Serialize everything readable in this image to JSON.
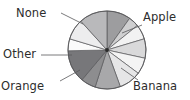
{
  "chart_data": {
    "type": "pie",
    "title": "",
    "xlabel": "",
    "ylabel": "",
    "legend_position": "none",
    "grid": false,
    "labeled_categories": [
      "Apple",
      "Banana",
      "Orange",
      "Other",
      "None"
    ],
    "categories": [
      "Apple",
      "slice-2",
      "slice-3",
      "Banana",
      "slice-5",
      "slice-6",
      "Orange",
      "slice-8",
      "Other",
      "slice-10",
      "None",
      "slice-12"
    ],
    "values": [
      32,
      14,
      20,
      26,
      22,
      30,
      34,
      20,
      44,
      16,
      28,
      38
    ],
    "start_angle_deg": -90,
    "direction": "clockwise",
    "colors": [
      "#9d9d9f",
      "#cfcfd0",
      "#f2f2f2",
      "#d9d9da",
      "#f4f4f4",
      "#e6e6e7",
      "#a8a8aa",
      "#8d8d8f",
      "#77777a",
      "#fbfbfb",
      "#ededee",
      "#b9b9bb"
    ],
    "outline_color": "#58585a",
    "center": {
      "x": 107,
      "y": 50
    },
    "radius": 39
  },
  "labels": {
    "none": "None",
    "apple": "Apple",
    "other": "Other",
    "orange": "Orange",
    "banana": "Banana"
  },
  "leader_lines": [
    {
      "name": "none",
      "x1": 61,
      "y1": 13,
      "x2": 83,
      "y2": 24
    },
    {
      "name": "apple",
      "x1": 142,
      "y1": 25,
      "x2": 122,
      "y2": 33
    },
    {
      "name": "other",
      "x1": 41,
      "y1": 55,
      "x2": 72,
      "y2": 55
    },
    {
      "name": "orange",
      "x1": 60,
      "y1": 81,
      "x2": 80,
      "y2": 70
    },
    {
      "name": "banana",
      "x1": 138,
      "y1": 80,
      "x2": 121,
      "y2": 68
    }
  ]
}
